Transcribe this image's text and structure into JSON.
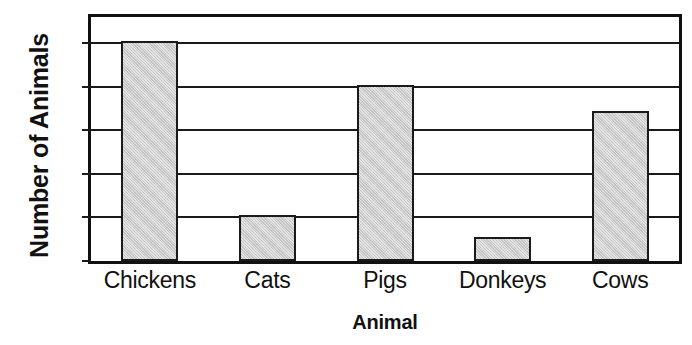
{
  "chart_data": {
    "type": "bar",
    "title": "",
    "xlabel": "Animal",
    "ylabel": "Number of Animals",
    "categories": [
      "Chickens",
      "Cats",
      "Pigs",
      "Donkeys",
      "Cows"
    ],
    "values": [
      10,
      2,
      8,
      1,
      6.8
    ],
    "yticks": [
      0,
      2,
      4,
      6,
      8,
      10
    ],
    "ytick_labels": [
      "0",
      "2",
      "4",
      "6",
      "8",
      "10"
    ],
    "ylim": [
      0,
      11.2
    ],
    "grid": "horizontal",
    "legend": "none",
    "bar_fill_color": "#c9c9c9",
    "bar_edge_color": "#1a1a1a",
    "axis_color": "#111111",
    "background_color": "#ffffff"
  }
}
